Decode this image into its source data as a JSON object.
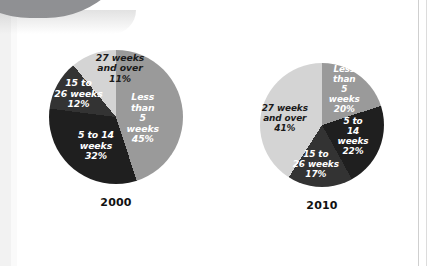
{
  "page": {
    "background_color": "#ffffff",
    "corner_shape_color": "#8f9093",
    "rule_color": "#cfcfcf"
  },
  "palette": {
    "less_than_5_weeks": "#9a9a9a",
    "5_to_14_weeks": "#1f1f1f",
    "15_to_26_weeks": "#333333",
    "27_weeks_and_over": "#d4d4d4"
  },
  "chart_data": [
    {
      "type": "pie",
      "title": "2000",
      "categories": [
        "Less than 5 weeks",
        "5 to 14 weeks",
        "15 to 26 weeks",
        "27 weeks and over"
      ],
      "values": [
        45,
        32,
        12,
        11
      ],
      "value_unit": "%",
      "colors": [
        "#9a9a9a",
        "#1f1f1f",
        "#333333",
        "#d4d4d4"
      ],
      "start_angle_deg": 0,
      "direction": "clockwise",
      "legend": "none",
      "labels": [
        {
          "text": "Less than\n5 weeks\n45%",
          "value": 45,
          "color_on": "dark",
          "x_pct": 70,
          "y_pct": 51
        },
        {
          "text": "5 to 14\nweeks\n32%",
          "value": 32,
          "color_on": "dark",
          "x_pct": 35,
          "y_pct": 72
        },
        {
          "text": "15 to\n26 weeks\n12%",
          "value": 12,
          "color_on": "dark",
          "x_pct": 22,
          "y_pct": 33
        },
        {
          "text": "27 weeks\nand over\n11%",
          "value": 11,
          "color_on": "light",
          "x_pct": 53,
          "y_pct": 14
        }
      ],
      "radius_px": 67
    },
    {
      "type": "pie",
      "title": "2010",
      "categories": [
        "Less than 5 weeks",
        "5 to 14 weeks",
        "15 to 26 weeks",
        "27 weeks and over"
      ],
      "values": [
        20,
        22,
        17,
        41
      ],
      "value_unit": "%",
      "colors": [
        "#9a9a9a",
        "#1f1f1f",
        "#333333",
        "#d4d4d4"
      ],
      "start_angle_deg": 0,
      "direction": "clockwise",
      "legend": "none",
      "labels": [
        {
          "text": "Less than\n5 weeks\n20%",
          "value": 20,
          "color_on": "dark",
          "x_pct": 68,
          "y_pct": 22
        },
        {
          "text": "5 to 14\nweeks\n22%",
          "value": 22,
          "color_on": "dark",
          "x_pct": 75,
          "y_pct": 60
        },
        {
          "text": "15 to\n26 weeks\n17%",
          "value": 17,
          "color_on": "dark",
          "x_pct": 45,
          "y_pct": 82
        },
        {
          "text": "27 weeks\nand over\n41%",
          "value": 41,
          "color_on": "light",
          "x_pct": 20,
          "y_pct": 45
        }
      ],
      "radius_px": 62
    }
  ],
  "captions": {
    "left_year": "2000",
    "right_year": "2010"
  }
}
